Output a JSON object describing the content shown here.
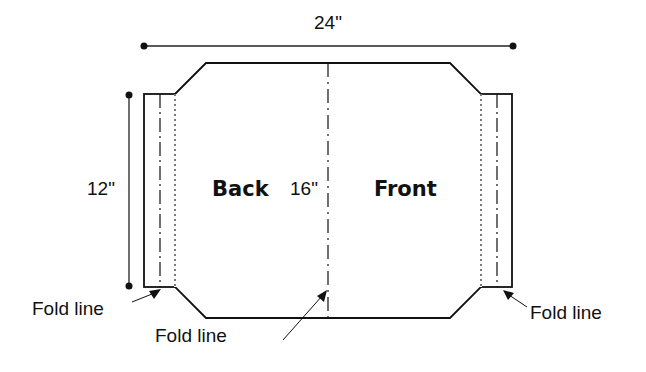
{
  "diagram": {
    "dimensions": {
      "width_label": "24\"",
      "height_label": "12\"",
      "panel_label": "16\""
    },
    "panels": {
      "left": "Back",
      "right": "Front"
    },
    "annotations": {
      "fold_left": "Fold line",
      "fold_center": "Fold line",
      "fold_right": "Fold line"
    },
    "colors": {
      "line": "#111111",
      "background": "#ffffff"
    }
  }
}
